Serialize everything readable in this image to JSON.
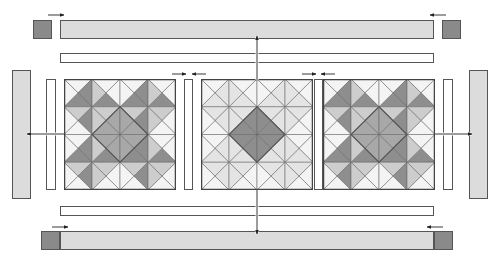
{
  "diagram": {
    "colors": {
      "outline": "#555555",
      "background": "#ffffff",
      "border_light": "#dcdcdc",
      "corner_square": "#8a8a8a",
      "sashing": "#ffffff",
      "shades": {
        "white": "#f4f4f4",
        "pale": "#e4e4e4",
        "light": "#cdcdcd",
        "medium": "#a8a8a8",
        "mid_dark": "#8e8e8e",
        "dark": "#747474"
      }
    },
    "blocks": [
      {
        "name": "left-block",
        "variant": "dark",
        "x": 64,
        "y": 79,
        "w": 112,
        "h": 111
      },
      {
        "name": "center-block",
        "variant": "light",
        "x": 201,
        "y": 79,
        "w": 112,
        "h": 111
      },
      {
        "name": "right-block",
        "variant": "dark",
        "x": 323,
        "y": 79,
        "w": 112,
        "h": 111
      }
    ],
    "sashing_strips": [
      {
        "name": "sashing-left",
        "x": 46,
        "y": 79,
        "w": 10,
        "h": 111
      },
      {
        "name": "sashing-mid-1",
        "x": 184,
        "y": 79,
        "w": 9,
        "h": 111
      },
      {
        "name": "sashing-mid-2",
        "x": 314,
        "y": 79,
        "w": 9,
        "h": 111
      },
      {
        "name": "sashing-right",
        "x": 443,
        "y": 79,
        "w": 10,
        "h": 111
      },
      {
        "name": "sashing-top",
        "x": 60,
        "y": 53,
        "w": 374,
        "h": 10
      },
      {
        "name": "sashing-bottom",
        "x": 60,
        "y": 206,
        "w": 374,
        "h": 10
      }
    ],
    "borders": [
      {
        "name": "border-top",
        "x": 60,
        "y": 20,
        "w": 374,
        "h": 19
      },
      {
        "name": "border-bottom",
        "x": 60,
        "y": 231,
        "w": 374,
        "h": 19
      },
      {
        "name": "border-left",
        "x": 12,
        "y": 70,
        "w": 19,
        "h": 129
      },
      {
        "name": "border-right",
        "x": 469,
        "y": 70,
        "w": 19,
        "h": 129
      }
    ],
    "corner_squares": [
      {
        "name": "corner-top-left",
        "x": 33,
        "y": 20,
        "w": 19,
        "h": 19
      },
      {
        "name": "corner-top-right",
        "x": 442,
        "y": 20,
        "w": 19,
        "h": 19
      },
      {
        "name": "corner-bottom-left",
        "x": 41,
        "y": 231,
        "w": 19,
        "h": 19
      },
      {
        "name": "corner-bottom-right",
        "x": 434,
        "y": 231,
        "w": 19,
        "h": 19
      }
    ],
    "arrows": [
      {
        "name": "press-arrow-top-left",
        "x1": 48,
        "y1": 15,
        "x2": 64,
        "y2": 15
      },
      {
        "name": "press-arrow-top-right",
        "x1": 446,
        "y1": 15,
        "x2": 430,
        "y2": 15
      },
      {
        "name": "press-arrow-bottom-left",
        "x1": 52,
        "y1": 227,
        "x2": 68,
        "y2": 227
      },
      {
        "name": "press-arrow-bottom-right",
        "x1": 443,
        "y1": 227,
        "x2": 427,
        "y2": 227
      },
      {
        "name": "press-arrow-sash1-a",
        "x1": 172,
        "y1": 74,
        "x2": 186,
        "y2": 74
      },
      {
        "name": "press-arrow-sash1-b",
        "x1": 206,
        "y1": 74,
        "x2": 192,
        "y2": 74
      },
      {
        "name": "press-arrow-sash2-a",
        "x1": 302,
        "y1": 74,
        "x2": 316,
        "y2": 74
      },
      {
        "name": "press-arrow-sash2-b",
        "x1": 335,
        "y1": 74,
        "x2": 321,
        "y2": 74
      },
      {
        "name": "assembly-arrow-up",
        "x1": 257,
        "y1": 80,
        "x2": 257,
        "y2": 36
      },
      {
        "name": "assembly-arrow-down",
        "x1": 257,
        "y1": 190,
        "x2": 257,
        "y2": 234
      },
      {
        "name": "assembly-arrow-left",
        "x1": 64,
        "y1": 134,
        "x2": 27,
        "y2": 134
      },
      {
        "name": "assembly-arrow-right",
        "x1": 435,
        "y1": 134,
        "x2": 472,
        "y2": 134
      }
    ]
  }
}
